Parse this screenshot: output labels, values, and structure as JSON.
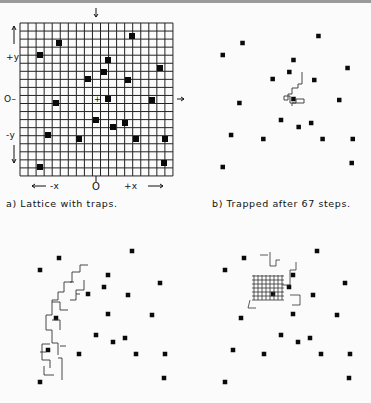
{
  "panels": [
    {
      "id": "a",
      "caption": "a) Lattice with traps."
    },
    {
      "id": "b",
      "caption": "b) Trapped after 67 steps."
    },
    {
      "id": "c",
      "caption": ""
    },
    {
      "id": "d",
      "caption": ""
    }
  ],
  "axes": {
    "plus_y": "+y",
    "origin_y": "O–",
    "minus_y": "-y",
    "minus_x": "-x",
    "origin_x": "O",
    "plus_x": "+x",
    "arrow_left": "←",
    "arrow_right": "→"
  },
  "lattice": {
    "x0": 20,
    "y0": 23,
    "cell": 8.05,
    "cols": 19,
    "rows": 19
  },
  "traps_a": [
    [
      132,
      36
    ],
    [
      59,
      43
    ],
    [
      40,
      55
    ],
    [
      108,
      60
    ],
    [
      104,
      72
    ],
    [
      160,
      68
    ],
    [
      88,
      79
    ],
    [
      128,
      80
    ],
    [
      56,
      103
    ],
    [
      108,
      99
    ],
    [
      152,
      100
    ],
    [
      96,
      120
    ],
    [
      113,
      127
    ],
    [
      125,
      123
    ],
    [
      48,
      135
    ],
    [
      79,
      139
    ],
    [
      136,
      139
    ],
    [
      165,
      139
    ],
    [
      164,
      163
    ],
    [
      40,
      167
    ]
  ],
  "walk_b_start": [
    292,
    99
  ],
  "walk_c_start": [
    88,
    265
  ],
  "walk_d_start": [
    282,
    279
  ]
}
